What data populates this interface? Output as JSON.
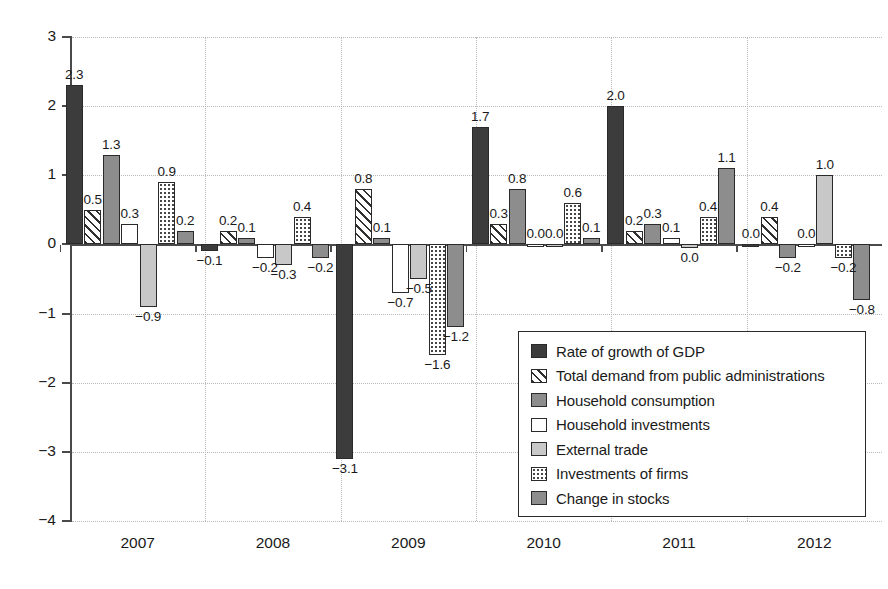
{
  "chart_data": {
    "type": "bar",
    "title": "",
    "subtitle": "",
    "xlabel": "",
    "ylabel": "",
    "ylim": [
      -4,
      3
    ],
    "ytick_values": [
      3,
      2,
      1,
      0,
      -1,
      -2,
      -3,
      -4
    ],
    "ytick_labels": [
      "3",
      "2",
      "1",
      "0",
      "−1",
      "−2",
      "−3",
      "−4"
    ],
    "grid": "dotted-both",
    "legend_position": "inside-lower-right",
    "categories": [
      "2007",
      "2008",
      "2009",
      "2010",
      "2011",
      "2012"
    ],
    "series": [
      {
        "name": "Rate of growth of GDP",
        "fill": "f-gdp",
        "color": "#3c3c3c",
        "values": [
          2.3,
          -0.1,
          -3.1,
          1.7,
          2.0,
          0.0
        ],
        "labels": [
          "2.3",
          "−0.1",
          "−3.1",
          "1.7",
          "2.0",
          "0.0"
        ]
      },
      {
        "name": "Total demand from public administrations",
        "fill": "f-public",
        "color": "#ffffff",
        "values": [
          0.5,
          0.2,
          0.8,
          0.3,
          0.2,
          0.4
        ],
        "labels": [
          "0.5",
          "0.2",
          "0.8",
          "0.3",
          "0.2",
          "0.4"
        ]
      },
      {
        "name": "Household consumption",
        "fill": "f-hhcons",
        "color": "#8d8d8d",
        "values": [
          1.3,
          0.1,
          0.1,
          0.8,
          0.3,
          -0.2
        ],
        "labels": [
          "1.3",
          "0.1",
          "0.1",
          "0.8",
          "0.3",
          "−0.2"
        ]
      },
      {
        "name": "Household investments",
        "fill": "f-hhinv",
        "color": "#ffffff",
        "values": [
          0.3,
          -0.2,
          -0.7,
          0.0,
          0.1,
          0.0
        ],
        "labels": [
          "0.3",
          "−0.2",
          "−0.7",
          "0.0",
          "0.1",
          "0.0"
        ]
      },
      {
        "name": "External trade",
        "fill": "f-exttrade",
        "color": "#c8c8c8",
        "values": [
          -0.9,
          -0.3,
          -0.5,
          0.0,
          -0.05,
          1.0
        ],
        "labels": [
          "−0.9",
          "−0.3",
          "−0.5",
          "0.0",
          "0.0",
          "1.0"
        ]
      },
      {
        "name": "Investments of firms",
        "fill": "f-firminv",
        "color": "#ffffff",
        "values": [
          0.9,
          0.4,
          -1.6,
          0.6,
          0.4,
          -0.2
        ],
        "labels": [
          "0.9",
          "0.4",
          "−1.6",
          "0.6",
          "0.4",
          "−0.2"
        ]
      },
      {
        "name": "Change in stocks",
        "fill": "f-stocks",
        "color": "#8d8d8d",
        "values": [
          0.2,
          -0.2,
          -1.2,
          0.1,
          1.1,
          -0.8
        ],
        "labels": [
          "0.2",
          "−0.2",
          "−1.2",
          "0.1",
          "1.1",
          "−0.8"
        ]
      }
    ]
  },
  "axis": {
    "y_labels": [
      "3",
      "2",
      "1",
      "0",
      "−1",
      "−2",
      "−3",
      "−4"
    ],
    "x_labels": [
      "2007",
      "2008",
      "2009",
      "2010",
      "2011",
      "2012"
    ]
  },
  "legend": {
    "items": [
      {
        "label": "Rate of growth of GDP",
        "swatch": "f-gdp"
      },
      {
        "label": "Total demand from public administrations",
        "swatch": "f-public"
      },
      {
        "label": "Household consumption",
        "swatch": "f-hhcons"
      },
      {
        "label": "Household investments",
        "swatch": "f-hhinv"
      },
      {
        "label": "External trade",
        "swatch": "f-exttrade"
      },
      {
        "label": "Investments of firms",
        "swatch": "f-firminv"
      },
      {
        "label": "Change in stocks",
        "swatch": "f-stocks"
      }
    ]
  }
}
